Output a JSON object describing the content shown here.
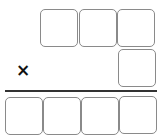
{
  "worksheet": {
    "type": "multiplication-layout",
    "operator": "×",
    "multiplicand_boxes": [
      {
        "value": ""
      },
      {
        "value": ""
      },
      {
        "value": ""
      }
    ],
    "multiplier_boxes": [
      {
        "value": ""
      }
    ],
    "product_boxes": [
      {
        "value": ""
      },
      {
        "value": ""
      },
      {
        "value": ""
      },
      {
        "value": ""
      }
    ],
    "colors": {
      "box_border": "#8a8a8a",
      "rule": "#333333",
      "operator": "#111111"
    }
  }
}
